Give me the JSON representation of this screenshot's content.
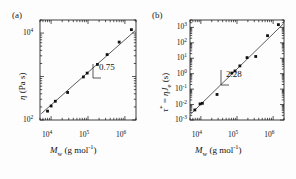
{
  "figure": {
    "background": "#fdfdfd",
    "ink": "#111111",
    "panel_count": 2
  },
  "panels": [
    {
      "id": "a",
      "label": "(a)",
      "slope_annotation": "0.75",
      "chart_ref": 0
    },
    {
      "id": "b",
      "label": "(b)",
      "slope_annotation": "2.28",
      "chart_ref": 1
    }
  ],
  "chart_data": [
    {
      "type": "scatter",
      "title": "",
      "panel": "(a)",
      "xlabel": "M_w (g mol^-1)",
      "xlabel_parts": {
        "symbol": "M",
        "subscript": "w",
        "units": "(g mol",
        "units_exp": "-1",
        "units_close": ")"
      },
      "ylabel": "eta (Pa s)",
      "ylabel_parts": {
        "symbol": "η",
        "units": "(Pa s)"
      },
      "xscale": "log",
      "yscale": "log",
      "xlim": [
        5000,
        2000000
      ],
      "ylim": [
        100,
        20000
      ],
      "xticks": [
        10000,
        100000,
        1000000
      ],
      "xtick_labels": [
        "10",
        "10",
        "10"
      ],
      "xtick_exponents": [
        "4",
        "5",
        "6"
      ],
      "yticks": [
        100,
        10000
      ],
      "ytick_labels": [
        "10",
        "10"
      ],
      "ytick_exponents": [
        "2",
        "4"
      ],
      "grid": false,
      "legend": "none",
      "marker": "square-filled",
      "marker_color": "#111111",
      "fit_line": {
        "slope": 0.75,
        "label": "0.75",
        "color": "#333333"
      },
      "points": [
        {
          "x": 8000,
          "y": 160
        },
        {
          "x": 10000,
          "y": 210
        },
        {
          "x": 13000,
          "y": 270
        },
        {
          "x": 28000,
          "y": 430
        },
        {
          "x": 75000,
          "y": 980
        },
        {
          "x": 95000,
          "y": 1200
        },
        {
          "x": 180000,
          "y": 1900
        },
        {
          "x": 330000,
          "y": 3200
        },
        {
          "x": 700000,
          "y": 6200
        },
        {
          "x": 1500000,
          "y": 12000
        }
      ],
      "annotation_triangle": {
        "text": "0.75",
        "slope": 0.75
      }
    },
    {
      "type": "scatter",
      "title": "",
      "panel": "(b)",
      "xlabel": "M_w (g mol^-1)",
      "xlabel_parts": {
        "symbol": "M",
        "subscript": "w",
        "units": "(g mol",
        "units_exp": "-1",
        "units_close": ")"
      },
      "ylabel": "tau* = eta J_e (s)",
      "ylabel_parts": {
        "symbol": "τ",
        "star": "*",
        "eq": " = ",
        "eta": "η",
        "jsym": "J",
        "jsub": "e",
        "units": " (s)"
      },
      "xscale": "log",
      "yscale": "log",
      "xlim": [
        5000,
        2000000
      ],
      "ylim": [
        0.001,
        3000
      ],
      "xticks": [
        10000,
        100000,
        1000000
      ],
      "xtick_labels": [
        "10",
        "10",
        "10"
      ],
      "xtick_exponents": [
        "4",
        "5",
        "6"
      ],
      "yticks": [
        0.001,
        0.01,
        0.1,
        1,
        10,
        100,
        1000
      ],
      "ytick_labels": [
        "10",
        "10",
        "10",
        "10",
        "10",
        "10",
        "10"
      ],
      "ytick_exponents": [
        "-3",
        "-2",
        "-1",
        "0",
        "1",
        "2",
        "3"
      ],
      "grid": false,
      "legend": "none",
      "marker": "square-filled",
      "marker_color": "#111111",
      "fit_line": {
        "slope": 2.28,
        "label": "2.28",
        "color": "#333333"
      },
      "points": [
        {
          "x": 6800,
          "y": 0.0045
        },
        {
          "x": 9500,
          "y": 0.011
        },
        {
          "x": 11000,
          "y": 0.012
        },
        {
          "x": 28000,
          "y": 0.045
        },
        {
          "x": 72000,
          "y": 1.1
        },
        {
          "x": 88000,
          "y": 1.5
        },
        {
          "x": 120000,
          "y": 3.2
        },
        {
          "x": 190000,
          "y": 11
        },
        {
          "x": 330000,
          "y": 13
        },
        {
          "x": 700000,
          "y": 290
        },
        {
          "x": 1400000,
          "y": 1500
        }
      ],
      "annotation_triangle": {
        "text": "2.28",
        "slope": 2.28
      }
    }
  ]
}
